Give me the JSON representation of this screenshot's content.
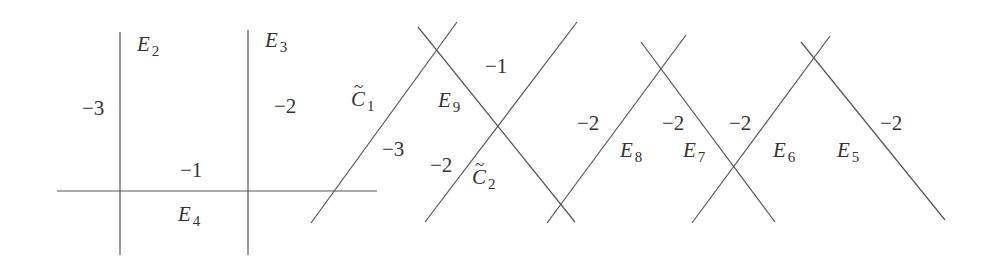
{
  "diagram": {
    "title": "",
    "colors": {
      "lines": "#555555",
      "text": "#333333",
      "background": "#ffffff"
    },
    "lines": [
      {
        "id": "v1",
        "x1": 120,
        "y1": 32,
        "x2": 120,
        "y2": 255
      },
      {
        "id": "v2",
        "x1": 248,
        "y1": 30,
        "x2": 248,
        "y2": 255
      },
      {
        "id": "h1",
        "x1": 57,
        "y1": 191,
        "x2": 377,
        "y2": 191
      },
      {
        "id": "c1",
        "x1": 311,
        "y1": 223,
        "x2": 457,
        "y2": 22
      },
      {
        "id": "e9",
        "x1": 418,
        "y1": 27,
        "x2": 575,
        "y2": 222
      },
      {
        "id": "c2",
        "x1": 425,
        "y1": 222,
        "x2": 577,
        "y2": 22
      },
      {
        "id": "e8",
        "x1": 547,
        "y1": 223,
        "x2": 686,
        "y2": 35
      },
      {
        "id": "e7",
        "x1": 641,
        "y1": 42,
        "x2": 775,
        "y2": 222
      },
      {
        "id": "e6",
        "x1": 692,
        "y1": 223,
        "x2": 830,
        "y2": 36
      },
      {
        "id": "e5",
        "x1": 801,
        "y1": 42,
        "x2": 945,
        "y2": 220
      }
    ],
    "curve_labels": [
      {
        "name": "E",
        "sub": "2",
        "tilde": false,
        "x": 137,
        "y": 34
      },
      {
        "name": "E",
        "sub": "3",
        "tilde": false,
        "x": 265,
        "y": 30
      },
      {
        "name": "E",
        "sub": "4",
        "tilde": false,
        "x": 178,
        "y": 204
      },
      {
        "name": "C",
        "sub": "1",
        "tilde": true,
        "x": 351,
        "y": 89
      },
      {
        "name": "E",
        "sub": "9",
        "tilde": false,
        "x": 438,
        "y": 90
      },
      {
        "name": "C",
        "sub": "2",
        "tilde": true,
        "x": 472,
        "y": 167
      },
      {
        "name": "E",
        "sub": "8",
        "tilde": false,
        "x": 620,
        "y": 140
      },
      {
        "name": "E",
        "sub": "7",
        "tilde": false,
        "x": 683,
        "y": 140
      },
      {
        "name": "E",
        "sub": "6",
        "tilde": false,
        "x": 773,
        "y": 140
      },
      {
        "name": "E",
        "sub": "5",
        "tilde": false,
        "x": 837,
        "y": 140
      }
    ],
    "self_intersections": [
      {
        "value": "−3",
        "x": 82,
        "y": 98
      },
      {
        "value": "−2",
        "x": 274,
        "y": 96
      },
      {
        "value": "−1",
        "x": 180,
        "y": 160
      },
      {
        "value": "−1",
        "x": 485,
        "y": 56
      },
      {
        "value": "−3",
        "x": 382,
        "y": 139
      },
      {
        "value": "−2",
        "x": 430,
        "y": 155
      },
      {
        "value": "−2",
        "x": 577,
        "y": 113
      },
      {
        "value": "−2",
        "x": 662,
        "y": 113
      },
      {
        "value": "−2",
        "x": 729,
        "y": 113
      },
      {
        "value": "−2",
        "x": 880,
        "y": 113
      }
    ]
  }
}
